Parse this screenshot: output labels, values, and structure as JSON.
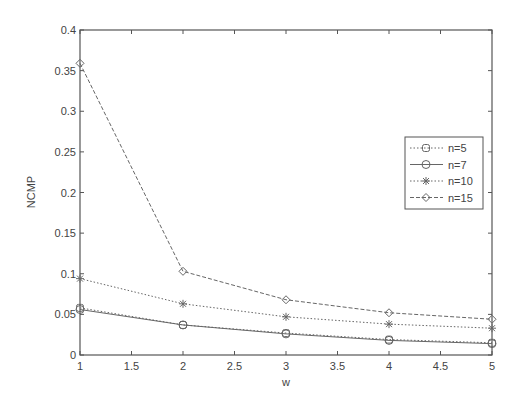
{
  "chart_data": {
    "type": "line",
    "title": "",
    "xlabel": "w",
    "ylabel": "NCMP",
    "xlim": [
      1,
      5
    ],
    "ylim": [
      0,
      0.4
    ],
    "x": [
      1,
      2,
      3,
      4,
      5
    ],
    "xticks": [
      "1",
      "1.5",
      "2",
      "2.5",
      "3",
      "3.5",
      "4",
      "4.5",
      "5"
    ],
    "yticks": [
      "0",
      "0.05",
      "0.1",
      "0.15",
      "0.2",
      "0.25",
      "0.3",
      "0.35",
      "0.4"
    ],
    "grid": false,
    "legend_position": "right-center",
    "series": [
      {
        "name": "n=5",
        "marker": "square",
        "line": "dotted",
        "values": [
          0.058,
          0.037,
          0.027,
          0.019,
          0.015
        ]
      },
      {
        "name": "n=7",
        "marker": "circle",
        "line": "solid",
        "values": [
          0.056,
          0.037,
          0.026,
          0.018,
          0.014
        ]
      },
      {
        "name": "n=10",
        "marker": "star",
        "line": "dotted",
        "values": [
          0.094,
          0.063,
          0.047,
          0.038,
          0.033
        ]
      },
      {
        "name": "n=15",
        "marker": "diamond",
        "line": "dashed",
        "values": [
          0.359,
          0.103,
          0.068,
          0.052,
          0.044
        ]
      }
    ]
  },
  "colors": {
    "axis": "#555555",
    "series_line": "#666666",
    "background": "#ffffff"
  }
}
